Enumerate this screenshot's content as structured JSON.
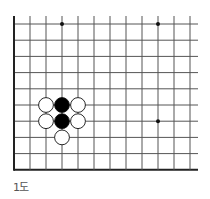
{
  "diagram": {
    "caption": "1도",
    "board": {
      "columns": 12,
      "rows": 10,
      "origin_x": 14,
      "origin_y": 24,
      "spacing_x": 16,
      "spacing_y": 16.2,
      "line_extend_right": 198,
      "edges": [
        "left",
        "bottom"
      ],
      "line_color": "#555555",
      "edge_color": "#222222"
    },
    "star_points": [
      {
        "col": 3,
        "row": 0
      },
      {
        "col": 9,
        "row": 0
      },
      {
        "col": 9,
        "row": 6
      }
    ],
    "stones": [
      {
        "color": "black",
        "col": 3,
        "row": 5
      },
      {
        "color": "black",
        "col": 3,
        "row": 6
      },
      {
        "color": "white",
        "col": 2,
        "row": 5
      },
      {
        "color": "white",
        "col": 4,
        "row": 5
      },
      {
        "color": "white",
        "col": 2,
        "row": 6
      },
      {
        "color": "white",
        "col": 4,
        "row": 6
      },
      {
        "color": "white",
        "col": 3,
        "row": 7
      }
    ]
  }
}
